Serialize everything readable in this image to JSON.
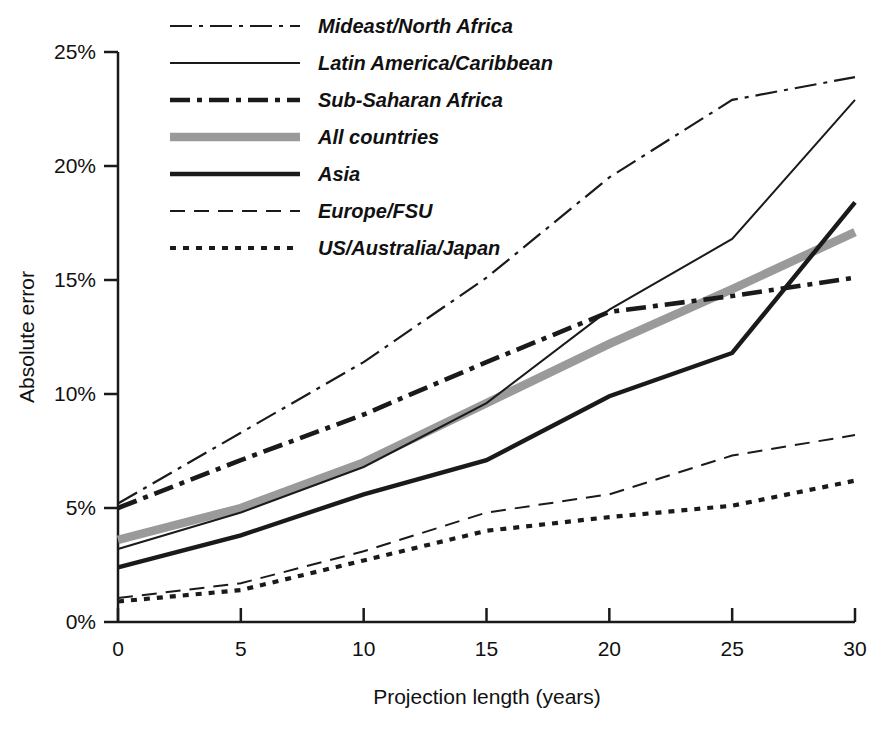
{
  "chart_data": {
    "type": "line",
    "title": "",
    "xlabel": "Projection length (years)",
    "ylabel": "Absolute error",
    "xlim": [
      0,
      30
    ],
    "ylim": [
      0,
      25
    ],
    "xticks": [
      0,
      5,
      10,
      15,
      20,
      25,
      30
    ],
    "xtick_labels": [
      "0",
      "5",
      "10",
      "15",
      "20",
      "25",
      "30"
    ],
    "yticks": [
      0,
      5,
      10,
      15,
      20,
      25
    ],
    "ytick_labels": [
      "0%",
      "5%",
      "10%",
      "15%",
      "20%",
      "25%"
    ],
    "grid": false,
    "legend_position": "top-left-inside",
    "x": [
      0,
      5,
      10,
      15,
      20,
      25,
      30
    ],
    "series": [
      {
        "name": "Mideast/North Africa",
        "style": "dash-dot-thin",
        "color": "#1a1a1a",
        "values": [
          5.2,
          8.3,
          11.4,
          15.1,
          19.5,
          22.9,
          23.9
        ]
      },
      {
        "name": "Latin America/Caribbean",
        "style": "solid-thin",
        "color": "#1a1a1a",
        "values": [
          3.2,
          4.8,
          6.8,
          9.6,
          13.7,
          16.8,
          22.9
        ]
      },
      {
        "name": "Sub-Saharan Africa",
        "style": "dash-dot-thick",
        "color": "#1a1a1a",
        "values": [
          5.0,
          7.1,
          9.1,
          11.4,
          13.6,
          14.3,
          15.1
        ]
      },
      {
        "name": "All countries",
        "style": "solid-gray-thick",
        "color": "#9a9a9a",
        "values": [
          3.6,
          5.0,
          7.0,
          9.6,
          12.2,
          14.6,
          17.1
        ]
      },
      {
        "name": "Asia",
        "style": "solid-thick",
        "color": "#1a1a1a",
        "values": [
          2.4,
          3.8,
          5.6,
          7.1,
          9.9,
          11.8,
          18.4
        ]
      },
      {
        "name": "Europe/FSU",
        "style": "dashed-thin",
        "color": "#1a1a1a",
        "values": [
          1.05,
          1.7,
          3.1,
          4.8,
          5.6,
          7.3,
          8.2
        ]
      },
      {
        "name": "US/Australia/Japan",
        "style": "dotted-thick",
        "color": "#1a1a1a",
        "values": [
          0.9,
          1.4,
          2.7,
          4.0,
          4.6,
          5.1,
          6.2
        ]
      }
    ],
    "legend_order": [
      "Mideast/North Africa",
      "Latin America/Caribbean",
      "Sub-Saharan Africa",
      "All countries",
      "Asia",
      "Europe/FSU",
      "US/Australia/Japan"
    ]
  }
}
